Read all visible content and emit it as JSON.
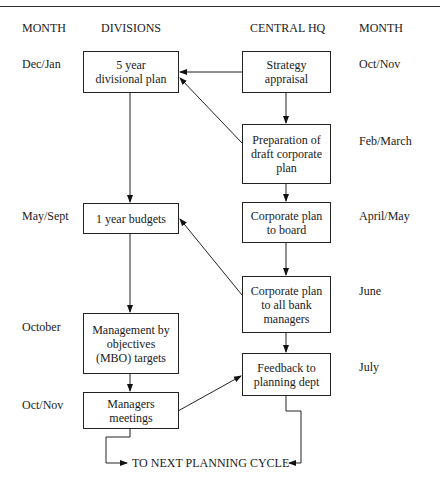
{
  "headers": {
    "month_left": "MONTH",
    "divisions": "DIVISIONS",
    "central_hq": "CENTRAL HQ",
    "month_right": "MONTH"
  },
  "months_left": {
    "row1": "Dec/Jan",
    "row2": "May/Sept",
    "row3": "October",
    "row4": "Oct/Nov"
  },
  "months_right": {
    "row1": "Oct/Nov",
    "row2": "Feb/March",
    "row3": "April/May",
    "row4": "June",
    "row5": "July"
  },
  "divisions": {
    "five_year_plan": "5 year\ndivisional plan",
    "one_year_budgets": "1 year budgets",
    "mbo_targets": "Management by\nobjectives\n(MBO) targets",
    "managers_meetings": "Managers\nmeetings"
  },
  "central_hq": {
    "strategy_appraisal": "Strategy\nappraisal",
    "draft_corporate_plan": "Preparation of\ndraft corporate\nplan",
    "plan_to_board": "Corporate plan\nto board",
    "plan_to_managers": "Corporate plan\nto all bank\nmanagers",
    "feedback": "Feedback to\nplanning dept"
  },
  "footer": {
    "next_cycle": "TO NEXT PLANNING CYCLE"
  }
}
